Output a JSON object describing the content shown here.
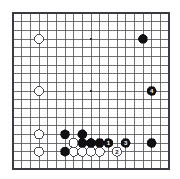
{
  "board": {
    "name": "go-board",
    "size": 19,
    "line_color": "#4d4d52",
    "border_color": "#3a3a3f",
    "background_color": "#ffffff",
    "black_color": "#111114",
    "white_color": "#ffffff",
    "white_outline_color": "#3a3a3f",
    "star_point_color": "#2b2b30",
    "geometry": {
      "left": 13,
      "top": 13,
      "right": 169,
      "bottom": 169,
      "spacing": 8.6667,
      "stone_radius": 4.6
    },
    "star_points": [
      {
        "col": 3,
        "row": 3
      },
      {
        "col": 9,
        "row": 3
      },
      {
        "col": 15,
        "row": 3
      },
      {
        "col": 3,
        "row": 9
      },
      {
        "col": 9,
        "row": 9
      },
      {
        "col": 15,
        "row": 9
      },
      {
        "col": 3,
        "row": 15
      },
      {
        "col": 9,
        "row": 15
      },
      {
        "col": 15,
        "row": 15
      }
    ],
    "visible_star_points": [
      {
        "col": 9,
        "row": 3
      },
      {
        "col": 9,
        "row": 9
      }
    ]
  },
  "stones": [
    {
      "id": "w-c3-r3",
      "color": "white",
      "col": 3,
      "row": 3,
      "label": ""
    },
    {
      "id": "b-c15-r3",
      "color": "black",
      "col": 15,
      "row": 3,
      "label": ""
    },
    {
      "id": "w-c3-r9",
      "color": "white",
      "col": 3,
      "row": 9,
      "label": ""
    },
    {
      "id": "b-c16-r9",
      "color": "black",
      "col": 16,
      "row": 9,
      "label": "4"
    },
    {
      "id": "w-c3-r14",
      "color": "white",
      "col": 3,
      "row": 14,
      "label": ""
    },
    {
      "id": "b-c6-r14",
      "color": "black",
      "col": 6,
      "row": 14,
      "label": ""
    },
    {
      "id": "b-c8-r14",
      "color": "black",
      "col": 8,
      "row": 14,
      "label": ""
    },
    {
      "id": "b-c13-r15",
      "color": "black",
      "col": 13,
      "row": 15,
      "label": "3"
    },
    {
      "id": "w-c3-r16",
      "color": "white",
      "col": 3,
      "row": 16,
      "label": ""
    },
    {
      "id": "w-c7-r15",
      "color": "white",
      "col": 7,
      "row": 15,
      "label": ""
    },
    {
      "id": "b-c8-r15",
      "color": "black",
      "col": 8,
      "row": 15,
      "label": ""
    },
    {
      "id": "b-c9-r15",
      "color": "black",
      "col": 9,
      "row": 15,
      "label": ""
    },
    {
      "id": "b-c10-r15",
      "color": "black",
      "col": 10,
      "row": 15,
      "label": ""
    },
    {
      "id": "b-c11-r15",
      "color": "black",
      "col": 11,
      "row": 15,
      "label": "1"
    },
    {
      "id": "b-c16-r15",
      "color": "black",
      "col": 16,
      "row": 15,
      "label": ""
    },
    {
      "id": "b-c6-r16",
      "color": "black",
      "col": 6,
      "row": 16,
      "label": ""
    },
    {
      "id": "w-c7-r16",
      "color": "white",
      "col": 7,
      "row": 16,
      "label": ""
    },
    {
      "id": "w-c8-r16",
      "color": "white",
      "col": 8,
      "row": 16,
      "label": ""
    },
    {
      "id": "w-c9-r16",
      "color": "white",
      "col": 9,
      "row": 16,
      "label": ""
    },
    {
      "id": "w-c10-r16",
      "color": "white",
      "col": 10,
      "row": 16,
      "label": ""
    },
    {
      "id": "w-c12-r16",
      "color": "white",
      "col": 12,
      "row": 16,
      "label": "2"
    }
  ],
  "move_numbers": {
    "sequence": [
      "1",
      "2",
      "3",
      "4"
    ],
    "black_label_color": "#ffffff",
    "white_label_color": "#111114"
  }
}
